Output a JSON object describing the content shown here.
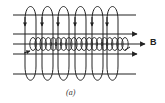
{
  "figure": {
    "field_label": "B",
    "caption": "(a)",
    "colors": {
      "stroke": "#222222",
      "background": "#ffffff"
    },
    "horizontal_lines": [
      {
        "name": "top-field-line",
        "y": 15,
        "x1": 13,
        "x2": 136,
        "arrow": false
      },
      {
        "name": "upper-field-line",
        "y": 34,
        "x1": 13,
        "x2": 137,
        "arrow": true
      },
      {
        "name": "axis-field-line",
        "y": 44,
        "x1": 13,
        "x2": 145,
        "arrow": true
      },
      {
        "name": "lower-field-line",
        "y": 54,
        "x1": 13,
        "x2": 137,
        "arrow": true
      },
      {
        "name": "bottom-field-line",
        "y": 74,
        "x1": 13,
        "x2": 136,
        "arrow": false
      }
    ],
    "outer_loops_x": [
      25,
      42,
      58,
      75,
      92,
      107
    ],
    "coil_turns": 19
  }
}
